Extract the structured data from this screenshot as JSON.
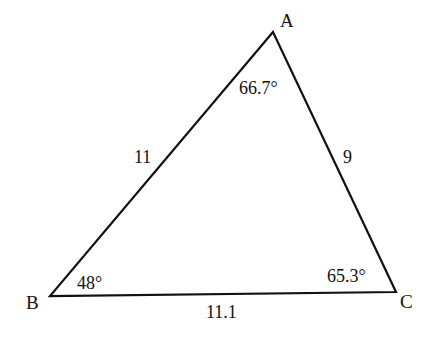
{
  "diagram": {
    "type": "triangle",
    "vertices": [
      {
        "name": "A",
        "x": 273,
        "y": 32
      },
      {
        "name": "B",
        "x": 50,
        "y": 296
      },
      {
        "name": "C",
        "x": 396,
        "y": 292
      }
    ],
    "sides": {
      "AB": "11",
      "AC": "9",
      "BC": "11.1"
    },
    "angles": {
      "A": "66.7°",
      "B": "48°",
      "C": "65.3°"
    },
    "stroke_color": "#111111"
  }
}
